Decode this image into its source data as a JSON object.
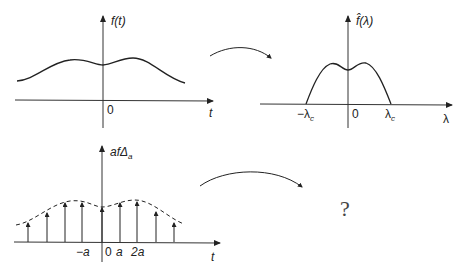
{
  "panels": {
    "signal": {
      "y_label": "f(t)",
      "x_label": "t",
      "origin_label": "0"
    },
    "spectrum": {
      "y_label": "f̂(λ)",
      "x_label": "λ",
      "origin_label": "0",
      "left_cutoff": "−λ",
      "right_cutoff": "λ",
      "cutoff_subscript": "c"
    },
    "sampled": {
      "y_label_main": "afΔ",
      "y_label_sub": "a",
      "x_label": "t",
      "ticks": [
        "−a",
        "0",
        "a",
        "2a"
      ]
    },
    "unknown": {
      "symbol": "?"
    }
  },
  "colors": {
    "ink": "#222222",
    "background": "#ffffff"
  }
}
